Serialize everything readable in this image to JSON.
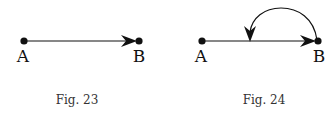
{
  "figures": [
    {
      "caption": "Fig. 23",
      "nodes": [
        {
          "label": "A"
        },
        {
          "label": "B"
        }
      ],
      "edges": [
        {
          "from": "A",
          "to": "B",
          "type": "straight-arrow"
        }
      ]
    },
    {
      "caption": "Fig. 24",
      "nodes": [
        {
          "label": "A"
        },
        {
          "label": "B"
        }
      ],
      "edges": [
        {
          "from": "A",
          "to": "B",
          "type": "straight-arrow"
        },
        {
          "from": "B",
          "to": "midpoint of AB",
          "type": "curved-arrow"
        }
      ]
    }
  ]
}
